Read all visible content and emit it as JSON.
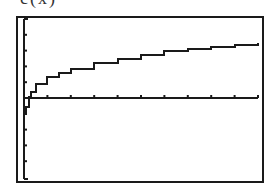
{
  "caption": "c(x)",
  "colors": {
    "ink": "#1a1a1a",
    "background": "#ffffff"
  },
  "chart_data": {
    "type": "line",
    "title": "c(x)",
    "xlabel": "",
    "ylabel": "",
    "grid": false,
    "axes": {
      "x_ticks": 10,
      "y_ticks_above": 4,
      "y_ticks_below": 4
    },
    "xlim": [
      0,
      10
    ],
    "ylim": [
      -5,
      5
    ],
    "x": [
      0.05,
      0.1,
      0.2,
      0.3,
      0.5,
      1,
      1.5,
      2,
      3,
      4,
      5,
      6,
      7,
      8,
      9,
      10
    ],
    "values": [
      -1.0,
      -0.55,
      0.05,
      0.4,
      0.9,
      1.3,
      1.6,
      1.85,
      2.2,
      2.5,
      2.75,
      2.95,
      3.1,
      3.25,
      3.35,
      3.45
    ]
  }
}
